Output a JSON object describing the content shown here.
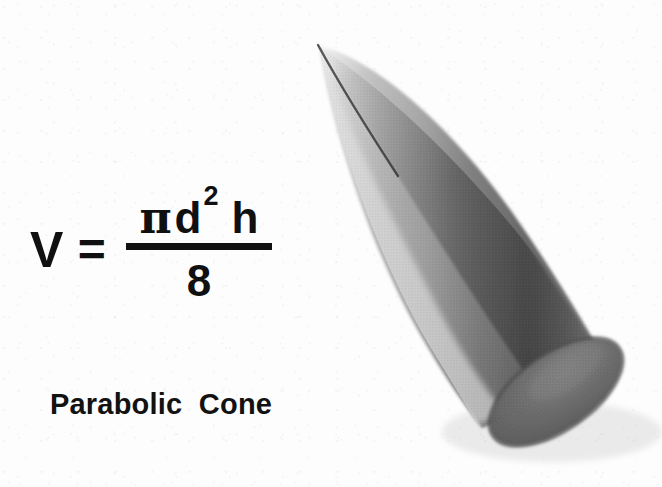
{
  "figure": {
    "background_color": "#fdfdfd",
    "caption": "Parabolic  Cone"
  },
  "formula": {
    "lhs": "V",
    "equals": "=",
    "numerator": {
      "pi": "π",
      "diameter": "d",
      "exponent": "2",
      "height": "h"
    },
    "denominator": "8"
  },
  "diagram": {
    "shape_name": "parabolic-cone",
    "apex": {
      "x": 318,
      "y": 45
    },
    "base_center": {
      "x": 556,
      "y": 392
    },
    "base_rx": 76,
    "base_ry": 37,
    "base_rotation_deg": -35,
    "colors": {
      "highlight": "#d2d2d2",
      "mid_gray": "#9a9a9a",
      "shadow": "#5f5f5f",
      "base_fill": "#6d6d6d",
      "base_edge": "#4a4a4a",
      "ink": "#111111"
    }
  }
}
